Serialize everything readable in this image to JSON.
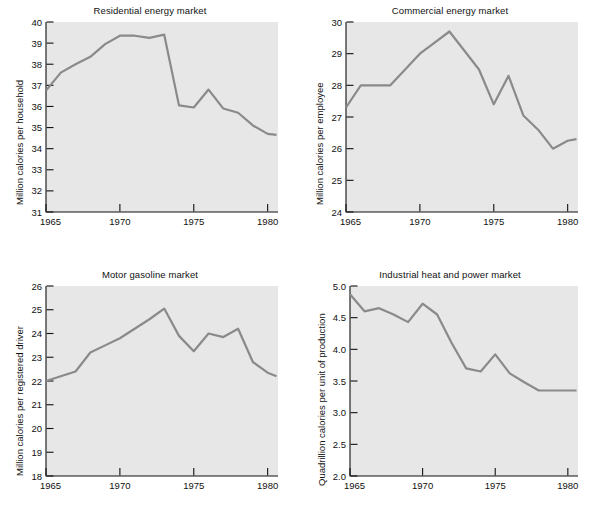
{
  "figure": {
    "background_color": "#ffffff",
    "plot_background_color": "#e7e7e7",
    "line_color": "#8a8a8a",
    "axis_color": "#111111",
    "cropped_caption_top": "Energy use per unit, by market (clipped)"
  },
  "chart_data": [
    {
      "type": "line",
      "title": "Residential energy market",
      "xlabel": "",
      "ylabel": "Million calories per household",
      "xlim": [
        1965,
        1980.7
      ],
      "ylim": [
        31,
        40
      ],
      "xticks": [
        1965,
        1970,
        1975,
        1980
      ],
      "xtick_labels": [
        "1965",
        "1970",
        "1975",
        "1980"
      ],
      "yticks": [
        31,
        32,
        33,
        34,
        35,
        36,
        37,
        38,
        39,
        40
      ],
      "ytick_labels": [
        "31",
        "32",
        "33",
        "34",
        "35",
        "36",
        "37",
        "38",
        "39",
        "40"
      ],
      "grid": false,
      "legend": "none",
      "x": [
        1965,
        1966,
        1967,
        1968,
        1969,
        1970,
        1971,
        1972,
        1973,
        1974,
        1975,
        1976,
        1977,
        1978,
        1979,
        1980,
        1980.6
      ],
      "values": [
        36.75,
        37.6,
        38.0,
        38.35,
        38.95,
        39.35,
        39.35,
        39.25,
        39.4,
        36.05,
        35.95,
        36.8,
        35.9,
        35.7,
        35.1,
        34.7,
        34.65
      ]
    },
    {
      "type": "line",
      "title": "Commercial energy market",
      "xlabel": "",
      "ylabel": "Million calories per employee",
      "xlim": [
        1965,
        1980.7
      ],
      "ylim": [
        24,
        30
      ],
      "xticks": [
        1965,
        1970,
        1975,
        1980
      ],
      "xtick_labels": [
        "1965",
        "1970",
        "1975",
        "1980"
      ],
      "yticks": [
        24,
        25,
        26,
        27,
        28,
        29,
        30
      ],
      "ytick_labels": [
        "24",
        "25",
        "26",
        "27",
        "28",
        "29",
        "30"
      ],
      "grid": false,
      "legend": "none",
      "x": [
        1965,
        1966,
        1967,
        1968,
        1969,
        1970,
        1971,
        1972,
        1973,
        1974,
        1975,
        1976,
        1977,
        1978,
        1979,
        1980,
        1980.6
      ],
      "values": [
        27.3,
        28.0,
        28.0,
        28.0,
        28.5,
        29.0,
        29.35,
        29.7,
        29.1,
        28.5,
        27.4,
        28.3,
        27.05,
        26.6,
        26.0,
        26.25,
        26.3
      ]
    },
    {
      "type": "line",
      "title": "Motor gasoline market",
      "xlabel": "",
      "ylabel": "Million calories per registered driver",
      "xlim": [
        1965,
        1980.7
      ],
      "ylim": [
        18,
        26
      ],
      "xticks": [
        1965,
        1970,
        1975,
        1980
      ],
      "xtick_labels": [
        "1965",
        "1970",
        "1975",
        "1980"
      ],
      "yticks": [
        18,
        19,
        20,
        21,
        22,
        23,
        24,
        25,
        26
      ],
      "ytick_labels": [
        "18",
        "19",
        "20",
        "21",
        "22",
        "23",
        "24",
        "25",
        "26"
      ],
      "grid": false,
      "legend": "none",
      "x": [
        1965,
        1966,
        1967,
        1968,
        1969,
        1970,
        1971,
        1972,
        1973,
        1974,
        1975,
        1976,
        1977,
        1978,
        1979,
        1980,
        1980.6
      ],
      "values": [
        22.0,
        22.2,
        22.4,
        23.2,
        23.5,
        23.8,
        24.2,
        24.6,
        25.05,
        23.9,
        23.25,
        24.0,
        23.85,
        24.2,
        22.8,
        22.35,
        22.2
      ]
    },
    {
      "type": "line",
      "title": "Industrial heat and power market",
      "xlabel": "",
      "ylabel": "Quadrillion calories per unit of production",
      "xlim": [
        1965,
        1980.7
      ],
      "ylim": [
        2.0,
        5.0
      ],
      "xticks": [
        1965,
        1970,
        1975,
        1980
      ],
      "xtick_labels": [
        "1965",
        "1970",
        "1975",
        "1980"
      ],
      "yticks": [
        2.0,
        2.5,
        3.0,
        3.5,
        4.0,
        4.5,
        5.0
      ],
      "ytick_labels": [
        "2.0",
        "2.5",
        "3.0",
        "3.5",
        "4.0",
        "4.5",
        "5.0"
      ],
      "grid": false,
      "legend": "none",
      "x": [
        1965,
        1966,
        1967,
        1968,
        1969,
        1970,
        1971,
        1972,
        1973,
        1974,
        1975,
        1976,
        1977,
        1978,
        1979,
        1980,
        1980.6
      ],
      "values": [
        4.87,
        4.6,
        4.65,
        4.55,
        4.43,
        4.72,
        4.55,
        4.1,
        3.7,
        3.65,
        3.92,
        3.62,
        3.48,
        3.35,
        3.35,
        3.35,
        3.35
      ]
    }
  ]
}
